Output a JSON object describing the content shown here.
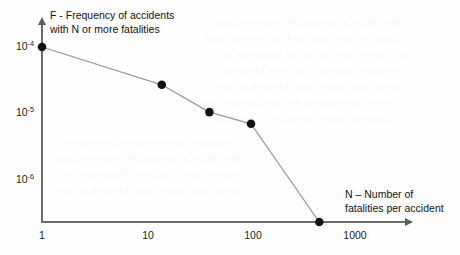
{
  "chart_data": {
    "type": "line",
    "title": "",
    "xlabel": "N – Number of fatalities per accident",
    "ylabel": "F - Frequency of accidents with N or more fatalities",
    "xscale": "log",
    "yscale": "log",
    "grid": false,
    "legend": null,
    "xlim": [
      1,
      2000
    ],
    "ylim": [
      1e-07,
      0.0002
    ],
    "xticks": [
      {
        "value": 1,
        "label": "1"
      },
      {
        "value": 10,
        "label": "10"
      },
      {
        "value": 100,
        "label": "100"
      },
      {
        "value": 1000,
        "label": "1000"
      }
    ],
    "yticks": [
      {
        "value": 0.0001,
        "mantissa": "10",
        "exponent": "-4"
      },
      {
        "value": 1e-05,
        "mantissa": "10",
        "exponent": "-5"
      },
      {
        "value": 1e-06,
        "mantissa": "10",
        "exponent": "-6"
      }
    ],
    "series": [
      {
        "name": "Frequency of accidents with N or more fatalities",
        "marker": "filled-circle",
        "marker_color": "#111111",
        "line_color": "#9a9a9a",
        "x": [
          1,
          14,
          40,
          100,
          450
        ],
        "y": [
          0.0001,
          2.7e-05,
          1.05e-05,
          7e-06,
          1e-07
        ]
      }
    ]
  },
  "axes": {
    "y_title_line1": "F - Frequency of accidents",
    "y_title_line2": "with N or more fatalities",
    "x_title_line1": "N – Number of",
    "x_title_line2": "fatalities per accident"
  },
  "ticks": {
    "y": [
      {
        "mantissa": "10",
        "exponent": "-4"
      },
      {
        "mantissa": "10",
        "exponent": "-5"
      },
      {
        "mantissa": "10",
        "exponent": "-6"
      }
    ],
    "x": [
      "1",
      "10",
      "100",
      "1000"
    ]
  },
  "background": {
    "bleed_lines": [
      "the risk of a catastrophic failure within",
      "of societal risk and the F-N curve is used",
      "to express the cumulative frequency of",
      "accidents causing N or more fatalities in",
      "a given population over a period of one",
      "year. The slope of the line indicates the",
      "aversion factor applied to large scale",
      "events in the assessment criteria set"
    ]
  },
  "colors": {
    "page_background": "#fefefe",
    "axis": "#6b6b6b",
    "marker": "#111111",
    "line": "#9a9a9a",
    "text": "#1a1a1a"
  }
}
